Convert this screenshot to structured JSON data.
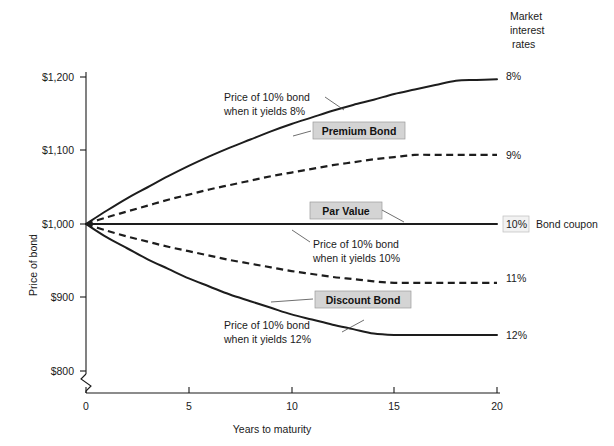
{
  "chart_data": {
    "type": "line",
    "title": "",
    "xlabel": "Years to maturity",
    "ylabel": "Price of bond",
    "xlim": [
      0,
      20
    ],
    "ylim": [
      800,
      1200
    ],
    "grid": false,
    "axis_break": true,
    "legend_position": "right",
    "legend_header": "Market interest rates",
    "x_ticks": [
      "0",
      "5",
      "10",
      "15",
      "20"
    ],
    "x_tick_values": [
      0,
      5,
      10,
      15,
      20
    ],
    "y_ticks": [
      "$800",
      "$900",
      "$1,000",
      "$1,100",
      "$1,200"
    ],
    "y_tick_values": [
      800,
      900,
      1000,
      1100,
      1200
    ],
    "x": [
      0,
      1,
      2,
      3,
      4,
      5,
      6,
      7,
      8,
      9,
      10,
      11,
      12,
      13,
      14,
      15,
      16,
      17,
      18,
      19,
      20
    ],
    "series": [
      {
        "name": "8%",
        "label": "8%",
        "style": "solid",
        "values": [
          1000,
          1018,
          1035,
          1050,
          1065,
          1079,
          1092,
          1104,
          1115,
          1126,
          1136,
          1145,
          1154,
          1162,
          1169,
          1177,
          1183,
          1189,
          1195,
          1196,
          1197
        ]
      },
      {
        "name": "9%",
        "label": "9%",
        "style": "dashed",
        "values": [
          1000,
          1009,
          1017,
          1025,
          1033,
          1040,
          1047,
          1053,
          1059,
          1065,
          1070,
          1075,
          1080,
          1084,
          1088,
          1091,
          1094,
          1094,
          1094,
          1094,
          1094
        ]
      },
      {
        "name": "10%",
        "label": "10%",
        "style": "solid",
        "values": [
          1000,
          1000,
          1000,
          1000,
          1000,
          1000,
          1000,
          1000,
          1000,
          1000,
          1000,
          1000,
          1000,
          1000,
          1000,
          1000,
          1000,
          1000,
          1000,
          1000,
          1000
        ]
      },
      {
        "name": "11%",
        "label": "11%",
        "style": "dashed",
        "values": [
          1000,
          991,
          983,
          976,
          969,
          963,
          957,
          951,
          946,
          941,
          936,
          932,
          928,
          925,
          922,
          920,
          920,
          920,
          920,
          920,
          920
        ]
      },
      {
        "name": "12%",
        "label": "12%",
        "style": "solid",
        "values": [
          1000,
          982,
          967,
          952,
          939,
          926,
          915,
          904,
          895,
          886,
          877,
          870,
          863,
          857,
          851,
          849,
          849,
          849,
          849,
          849,
          849
        ]
      }
    ],
    "annotations": [
      {
        "id": "premium-bond",
        "text": "Premium Bond",
        "boxed": true,
        "bold": true
      },
      {
        "id": "par-value",
        "text": "Par Value",
        "boxed": true,
        "bold": true
      },
      {
        "id": "discount-bond",
        "text": "Discount Bond",
        "boxed": true,
        "bold": true
      },
      {
        "id": "note-8",
        "line1": "Price of 10% bond",
        "line2": "when it yields 8%"
      },
      {
        "id": "note-10",
        "line1": "Price of 10% bond",
        "line2": "when it yields 10%"
      },
      {
        "id": "note-12",
        "line1": "Price of 10% bond",
        "line2": "when it yields 12%"
      }
    ]
  },
  "legend": {
    "header_line1": "Market",
    "header_line2": "interest",
    "header_line3": "rates",
    "items": [
      {
        "label": "8%"
      },
      {
        "label": "9%"
      },
      {
        "label": "10%",
        "boxed": true,
        "suffix": "Bond coupon"
      },
      {
        "label": "11%"
      },
      {
        "label": "12%"
      }
    ],
    "coupon_caption": "Bond coupon"
  },
  "axes": {
    "y_label": "Price of bond",
    "x_label": "Years to maturity",
    "y_tick_1200": "$1,200",
    "y_tick_1100": "$1,100",
    "y_tick_1000": "$1,000",
    "y_tick_900": "$900",
    "y_tick_800": "$800",
    "x_tick_0": "0",
    "x_tick_5": "5",
    "x_tick_10": "10",
    "x_tick_15": "15",
    "x_tick_20": "20"
  },
  "callouts": {
    "premium_bond": "Premium Bond",
    "par_value": "Par Value",
    "discount_bond": "Discount Bond",
    "note8_line1": "Price of 10% bond",
    "note8_line2": "when it yields 8%",
    "note10_line1": "Price of 10% bond",
    "note10_line2": "when it yields 10%",
    "note12_line1": "Price of 10% bond",
    "note12_line2": "when it yields 12%"
  },
  "colors": {
    "ink": "#1a1a1a",
    "curve": "#1d1d1d",
    "callout_fill": "#d4d4d4",
    "coupon_fill": "#f2f2f2",
    "background": "#ffffff"
  }
}
